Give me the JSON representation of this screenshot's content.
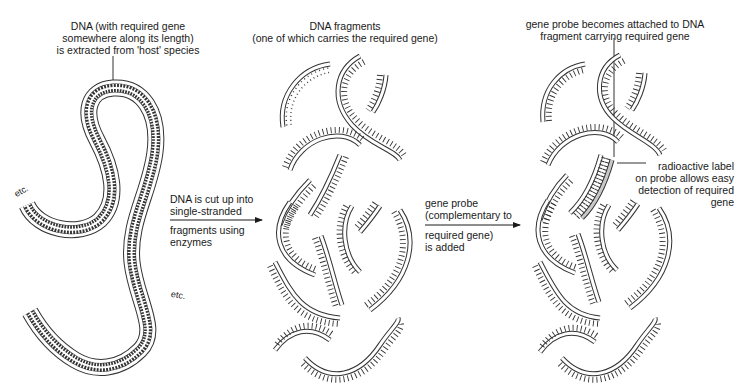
{
  "diagram": {
    "type": "process-flow",
    "stages": [
      {
        "id": "stage-1",
        "caption": [
          "DNA (with required gene",
          "somewhere along its length)",
          "is extracted from 'host' species"
        ],
        "element": "double-stranded DNA (long looped strand)",
        "end_labels": [
          "etc.",
          "etc."
        ]
      },
      {
        "id": "stage-2",
        "caption": [
          "DNA fragments",
          "(one of which carries the required gene)"
        ],
        "element": "single-stranded DNA fragments"
      },
      {
        "id": "stage-3",
        "caption": [
          "gene probe becomes attached to DNA",
          "fragment carrying required gene"
        ],
        "element": "fragments with bound probe",
        "annotation": [
          "radioactive label",
          "on probe allows easy",
          "detection of required",
          "gene"
        ]
      }
    ],
    "arrows": [
      {
        "from": "stage-1",
        "to": "stage-2",
        "label_above": [
          "DNA is cut up into",
          "single-stranded"
        ],
        "label_below": [
          "fragments using",
          "enzymes"
        ]
      },
      {
        "from": "stage-2",
        "to": "stage-3",
        "label_above": [
          "gene probe",
          "(complementary to"
        ],
        "label_below": [
          "required gene)",
          "is added"
        ]
      }
    ],
    "colors": {
      "line": "#333333",
      "probe_fill": "#c8c8c8",
      "text": "#1a1a1a"
    }
  }
}
